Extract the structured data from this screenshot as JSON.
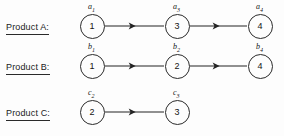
{
  "figure": {
    "background_color": "#fdfdfd",
    "ink_color": "#242424",
    "width": 284,
    "height": 136
  },
  "rows": [
    {
      "label": "Product A:",
      "label_x": 6,
      "label_y": 22,
      "nodes": [
        {
          "value": "1",
          "tag_letter": "a",
          "tag_sub": "1",
          "cx": 92,
          "cy": 26
        },
        {
          "value": "3",
          "tag_letter": "a",
          "tag_sub": "3",
          "cx": 177,
          "cy": 26
        },
        {
          "value": "4",
          "tag_letter": "a",
          "tag_sub": "4",
          "cx": 260,
          "cy": 26
        }
      ],
      "edges": [
        {
          "x1": 105,
          "x2": 164,
          "y": 26
        },
        {
          "x1": 190,
          "x2": 247,
          "y": 26
        }
      ]
    },
    {
      "label": "Product B:",
      "label_x": 6,
      "label_y": 62,
      "nodes": [
        {
          "value": "1",
          "tag_letter": "b",
          "tag_sub": "1",
          "cx": 92,
          "cy": 66
        },
        {
          "value": "2",
          "tag_letter": "b",
          "tag_sub": "2",
          "cx": 177,
          "cy": 66
        },
        {
          "value": "4",
          "tag_letter": "b",
          "tag_sub": "4",
          "cx": 260,
          "cy": 66
        }
      ],
      "edges": [
        {
          "x1": 105,
          "x2": 164,
          "y": 66
        },
        {
          "x1": 190,
          "x2": 247,
          "y": 66
        }
      ]
    },
    {
      "label": "Product C:",
      "label_x": 6,
      "label_y": 108,
      "nodes": [
        {
          "value": "2",
          "tag_letter": "c",
          "tag_sub": "2",
          "cx": 92,
          "cy": 112
        },
        {
          "value": "3",
          "tag_letter": "c",
          "tag_sub": "3",
          "cx": 177,
          "cy": 112
        }
      ],
      "edges": [
        {
          "x1": 105,
          "x2": 164,
          "y": 112
        }
      ]
    }
  ]
}
